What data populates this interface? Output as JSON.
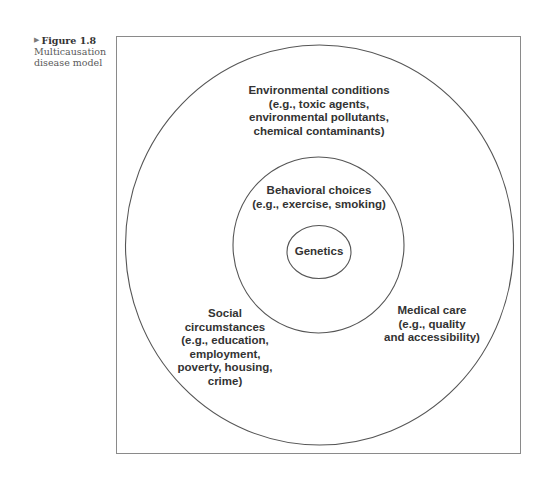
{
  "caption": {
    "marker": "▶",
    "figure_label": "Figure 1.8",
    "description_lines": [
      "Multicausation",
      "disease model"
    ]
  },
  "diagram": {
    "title": "Multicausation disease model",
    "type": "concentric-circles",
    "stroke_color": "#555555",
    "frame_color": "#8a8a8a",
    "layers": [
      {
        "name": "Genetics",
        "lines": [
          "Genetics"
        ]
      },
      {
        "name": "Behavioral choices",
        "lines": [
          "Behavioral choices",
          "(e.g., exercise, smoking)"
        ]
      },
      {
        "name": "Environmental conditions",
        "lines": [
          "Environmental conditions",
          "(e.g., toxic agents,",
          "environmental pollutants,",
          "chemical contaminants)"
        ]
      }
    ],
    "outer_labels": {
      "social": {
        "lines": [
          "Social",
          "circumstances",
          "(e.g., education,",
          "employment,",
          "poverty, housing,",
          "crime)"
        ]
      },
      "medical": {
        "lines": [
          "Medical care",
          "(e.g., quality",
          "and accessibility)"
        ]
      }
    }
  }
}
